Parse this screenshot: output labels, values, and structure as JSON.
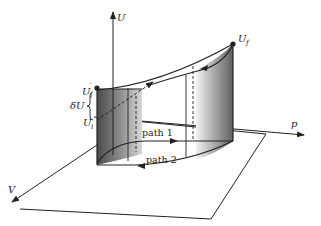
{
  "diagram": {
    "axes": {
      "vertical": "U",
      "right": "p",
      "left": "V"
    },
    "points": {
      "final": {
        "label": "U",
        "subscript": "f"
      },
      "initial": {
        "label": "U",
        "subscript": "i"
      },
      "initial_prime": {
        "label": "U",
        "subscript": "i",
        "prime": "′"
      }
    },
    "difference_label": "δU",
    "paths": [
      {
        "label": "path 1"
      },
      {
        "label": "path 2"
      }
    ],
    "colors": {
      "line": "#222222",
      "shade_dark": "#555555",
      "shade_light": "#e6e6e6"
    }
  }
}
